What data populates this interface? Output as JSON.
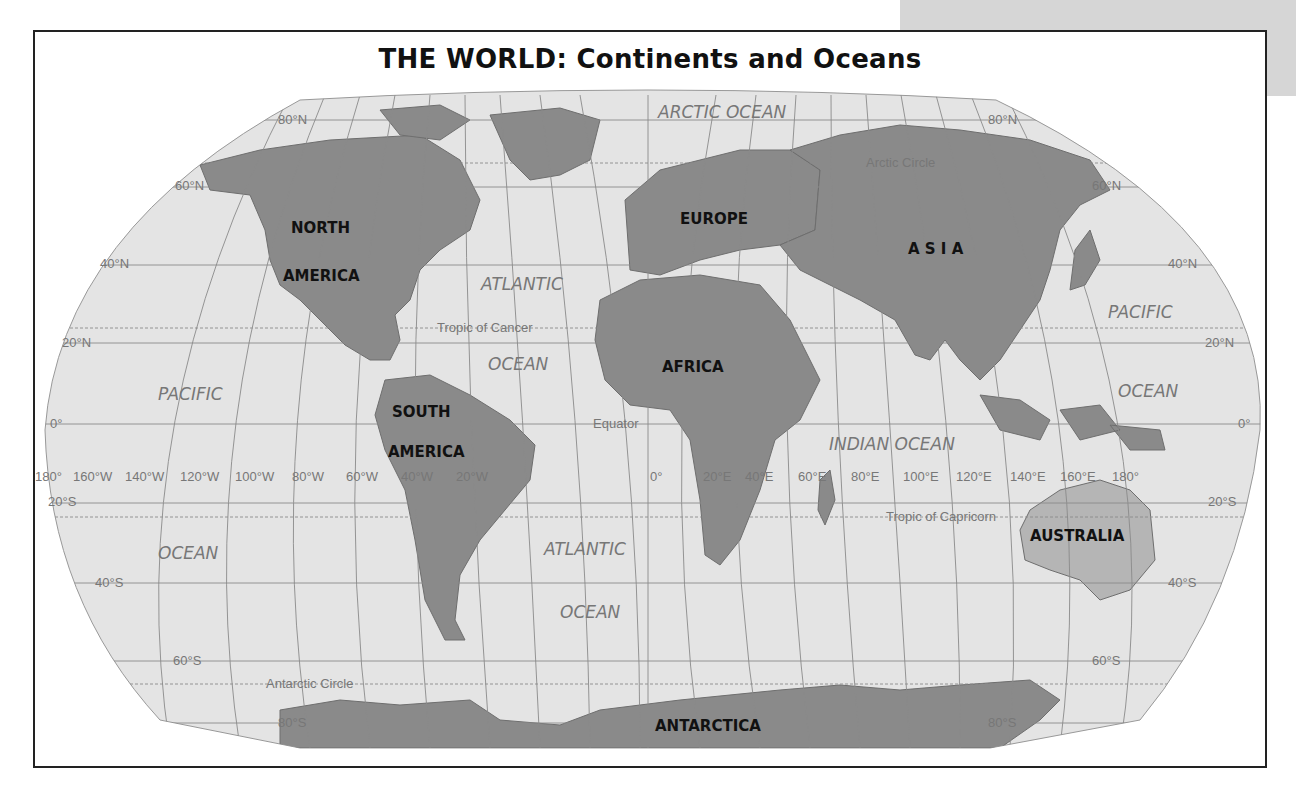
{
  "title": "THE WORLD: Continents and Oceans",
  "continents": {
    "north_america_1": "NORTH",
    "north_america_2": "AMERICA",
    "south_america_1": "SOUTH",
    "south_america_2": "AMERICA",
    "europe": "EUROPE",
    "asia": "A S I A",
    "africa": "AFRICA",
    "australia": "AUSTRALIA",
    "antarctica": "ANTARCTICA"
  },
  "oceans": {
    "arctic": "ARCTIC   OCEAN",
    "atlantic_n_1": "ATLANTIC",
    "atlantic_n_2": "OCEAN",
    "atlantic_s_1": "ATLANTIC",
    "atlantic_s_2": "OCEAN",
    "pacific_w_1": "PACIFIC",
    "pacific_w_2": "OCEAN",
    "pacific_e_1": "PACIFIC",
    "pacific_e_2": "OCEAN",
    "indian": "INDIAN OCEAN"
  },
  "lines": {
    "arctic_circle": "Arctic Circle",
    "tropic_cancer": "Tropic of Cancer",
    "equator": "Equator",
    "tropic_capricorn": "Tropic of Capricorn",
    "antarctic_circle": "Antarctic Circle"
  },
  "latitudes": {
    "n80": "80°N",
    "n60": "60°N",
    "n40": "40°N",
    "n20": "20°N",
    "eq": "0°",
    "s20": "20°S",
    "s40": "40°S",
    "s60": "60°S",
    "s80": "80°S"
  },
  "longitudes": [
    "180°",
    "160°W",
    "140°W",
    "120°W",
    "100°W",
    "80°W",
    "60°W",
    "40°W",
    "20°W",
    "0°",
    "20°E",
    "40°E",
    "60°E",
    "80°E",
    "100°E",
    "120°E",
    "140°E",
    "160°E",
    "180°"
  ],
  "colors": {
    "land": "#8a8a8a",
    "ocean": "#e4e4e4",
    "grid": "#8a8a8a",
    "frame": "#222222"
  }
}
